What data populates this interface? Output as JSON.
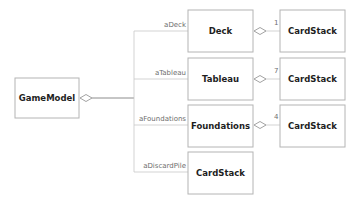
{
  "diagram": {
    "type": "uml-class-aggregation",
    "root": {
      "name": "GameModel"
    },
    "children": [
      {
        "role": "aDeck",
        "class": "Deck",
        "part": "CardStack",
        "multiplicity": "1"
      },
      {
        "role": "aTableau",
        "class": "Tableau",
        "part": "CardStack",
        "multiplicity": "7"
      },
      {
        "role": "aFoundations",
        "class": "Foundations",
        "part": "CardStack",
        "multiplicity": "4"
      },
      {
        "role": "aDiscardPile",
        "class": "CardStack"
      }
    ],
    "colors": {
      "box_border": "#b4b4b4",
      "text": "#1e1e1e",
      "label": "#6e6e6e"
    }
  }
}
